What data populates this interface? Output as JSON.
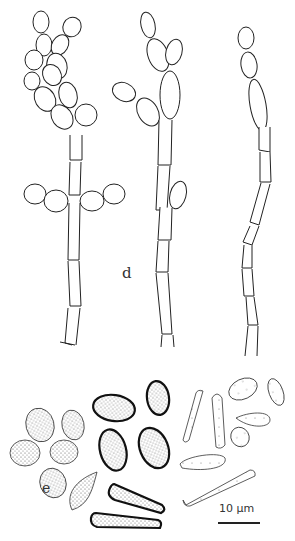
{
  "figure": {
    "panels": [
      {
        "id": "d",
        "label": "d",
        "description": "Three chains of conidia/hyphal cells with branching ellipsoidal cells"
      },
      {
        "id": "e",
        "label": "e",
        "description": "Groups of spores: stippled ovoid spores, thick-walled stippled ellipsoids and rods, thin-walled sparsely dotted cylindrical spores"
      }
    ],
    "scale_bar": {
      "label": "10 µm"
    },
    "colors": {
      "line": "#222222",
      "stipple": "#555555",
      "background": "#ffffff"
    }
  }
}
